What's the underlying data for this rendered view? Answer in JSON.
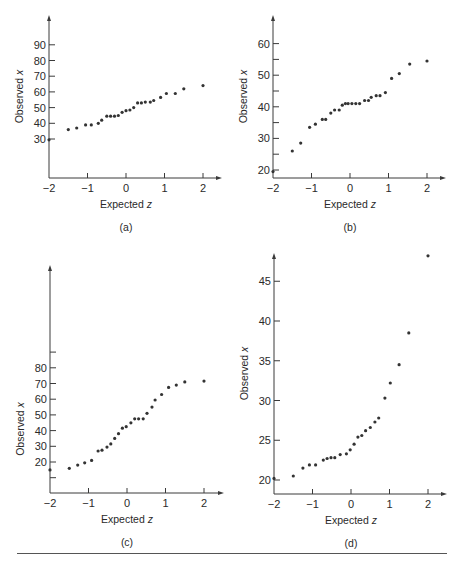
{
  "figure": {
    "panels": [
      "(a)",
      "(b)",
      "(c)",
      "(d)"
    ]
  },
  "chart_data": [
    {
      "type": "scatter",
      "panel_label": "(a)",
      "title": "",
      "xlabel": "Expected z",
      "ylabel": "Observed x",
      "xlim": [
        -2,
        2.4
      ],
      "xticks": [
        -2,
        -1,
        0,
        1,
        2
      ],
      "yticks": [
        30,
        40,
        50,
        60,
        70,
        80,
        90
      ],
      "ylim": [
        5,
        100
      ],
      "grid": false,
      "geom": {
        "x0": 49,
        "xs": 38.5,
        "yref": 139,
        "yrefv": 30,
        "ys": 1.57,
        "axisY": 178,
        "top": 15,
        "right": 222
      },
      "points": [
        [
          -2,
          29.5
        ],
        [
          -1.5,
          36
        ],
        [
          -1.28,
          37
        ],
        [
          -1.05,
          39
        ],
        [
          -0.9,
          39
        ],
        [
          -0.72,
          40
        ],
        [
          -0.63,
          42
        ],
        [
          -0.5,
          44.5
        ],
        [
          -0.4,
          44.5
        ],
        [
          -0.3,
          44.5
        ],
        [
          -0.2,
          45
        ],
        [
          -0.1,
          47
        ],
        [
          0,
          48
        ],
        [
          0.1,
          48.5
        ],
        [
          0.2,
          50
        ],
        [
          0.3,
          53
        ],
        [
          0.4,
          53
        ],
        [
          0.5,
          53.5
        ],
        [
          0.63,
          53.5
        ],
        [
          0.72,
          54.5
        ],
        [
          0.9,
          56.5
        ],
        [
          1.05,
          59
        ],
        [
          1.28,
          59
        ],
        [
          1.5,
          62
        ],
        [
          2,
          64
        ]
      ]
    },
    {
      "type": "scatter",
      "panel_label": "(b)",
      "title": "",
      "xlabel": "Expected z",
      "ylabel": "Observed x",
      "xlim": [
        -2,
        2.4
      ],
      "xticks": [
        -2,
        -1,
        0,
        1,
        2
      ],
      "yticks": [
        20,
        25,
        30,
        35,
        40,
        45,
        50,
        55,
        60
      ],
      "ytick_labels": [
        "20",
        "",
        "30",
        "",
        "40",
        "",
        "50",
        "",
        "60"
      ],
      "ylim": [
        17.5,
        64
      ],
      "grid": false,
      "geom": {
        "x0": 273,
        "xs": 38.5,
        "yref": 170,
        "yrefv": 20,
        "ys": 3.16,
        "axisY": 178,
        "top": 15,
        "right": 446
      },
      "points": [
        [
          -2,
          19.5
        ],
        [
          -1.5,
          26
        ],
        [
          -1.28,
          28.5
        ],
        [
          -1.05,
          33.5
        ],
        [
          -0.9,
          34.5
        ],
        [
          -0.72,
          36
        ],
        [
          -0.63,
          36
        ],
        [
          -0.5,
          38
        ],
        [
          -0.4,
          39
        ],
        [
          -0.28,
          39
        ],
        [
          -0.2,
          40.5
        ],
        [
          -0.12,
          41
        ],
        [
          -0.05,
          41
        ],
        [
          0.05,
          41
        ],
        [
          0.15,
          41
        ],
        [
          0.25,
          41
        ],
        [
          0.38,
          42
        ],
        [
          0.48,
          42
        ],
        [
          0.55,
          43
        ],
        [
          0.68,
          43.5
        ],
        [
          0.78,
          43.5
        ],
        [
          0.92,
          44.5
        ],
        [
          1.08,
          49
        ],
        [
          1.28,
          50.5
        ],
        [
          1.55,
          53.5
        ],
        [
          2,
          54.5
        ]
      ]
    },
    {
      "type": "scatter",
      "panel_label": "(c)",
      "title": "",
      "xlabel": "Expected z",
      "ylabel": "Observed x",
      "xlim": [
        -2,
        2.4
      ],
      "xticks": [
        -2,
        -1,
        0,
        1,
        2
      ],
      "yticks": [
        10,
        20,
        30,
        40,
        50,
        60,
        70,
        80,
        90
      ],
      "ytick_labels": [
        "",
        "20",
        "30",
        "40",
        "50",
        "60",
        "70",
        "80",
        ""
      ],
      "ylim": [
        0,
        145
      ],
      "grid": false,
      "geom": {
        "x0": 50,
        "xs": 38.5,
        "yref": 462,
        "yrefv": 20,
        "ys": 1.57,
        "axisY": 493,
        "top": 265,
        "right": 224
      },
      "points": [
        [
          -2,
          15
        ],
        [
          -1.5,
          16
        ],
        [
          -1.28,
          18
        ],
        [
          -1.1,
          19.5
        ],
        [
          -0.92,
          21
        ],
        [
          -0.75,
          27
        ],
        [
          -0.65,
          27.5
        ],
        [
          -0.52,
          29.5
        ],
        [
          -0.42,
          31.5
        ],
        [
          -0.32,
          35
        ],
        [
          -0.22,
          38
        ],
        [
          -0.12,
          41.5
        ],
        [
          -0.02,
          42.5
        ],
        [
          0.1,
          45
        ],
        [
          0.2,
          47.5
        ],
        [
          0.3,
          47.5
        ],
        [
          0.42,
          47.5
        ],
        [
          0.52,
          51
        ],
        [
          0.65,
          55
        ],
        [
          0.73,
          59.5
        ],
        [
          0.9,
          63
        ],
        [
          1.08,
          67.5
        ],
        [
          1.28,
          69
        ],
        [
          1.5,
          71
        ],
        [
          2,
          71.5
        ]
      ]
    },
    {
      "type": "scatter",
      "panel_label": "(d)",
      "title": "",
      "xlabel": "Expected z",
      "ylabel": "Observed x",
      "xlim": [
        -2,
        2.4
      ],
      "xticks": [
        -2,
        -1,
        0,
        1,
        2
      ],
      "yticks": [
        20,
        25,
        30,
        35,
        40,
        45
      ],
      "ytick_labels": [
        "20",
        "25",
        "30",
        "35",
        "40",
        "45"
      ],
      "ylim": [
        18.2,
        48.5
      ],
      "grid": false,
      "geom": {
        "x0": 274,
        "xs": 38.5,
        "yref": 480,
        "yrefv": 20,
        "ys": 7.95,
        "axisY": 494,
        "top": 253,
        "right": 447
      },
      "points": [
        [
          -2,
          20.2
        ],
        [
          -1.5,
          20.5
        ],
        [
          -1.25,
          21.5
        ],
        [
          -1.08,
          21.9
        ],
        [
          -0.92,
          21.9
        ],
        [
          -0.72,
          22.5
        ],
        [
          -0.62,
          22.7
        ],
        [
          -0.52,
          22.8
        ],
        [
          -0.42,
          22.8
        ],
        [
          -0.28,
          23.2
        ],
        [
          -0.12,
          23.3
        ],
        [
          -0.02,
          23.8
        ],
        [
          0.08,
          24.5
        ],
        [
          0.18,
          25.4
        ],
        [
          0.28,
          25.6
        ],
        [
          0.38,
          26.2
        ],
        [
          0.5,
          26.6
        ],
        [
          0.62,
          27.3
        ],
        [
          0.72,
          27.8
        ],
        [
          0.88,
          30.3
        ],
        [
          1.02,
          32.2
        ],
        [
          1.25,
          34.5
        ],
        [
          1.5,
          38.5
        ],
        [
          2,
          48.2
        ]
      ]
    }
  ]
}
